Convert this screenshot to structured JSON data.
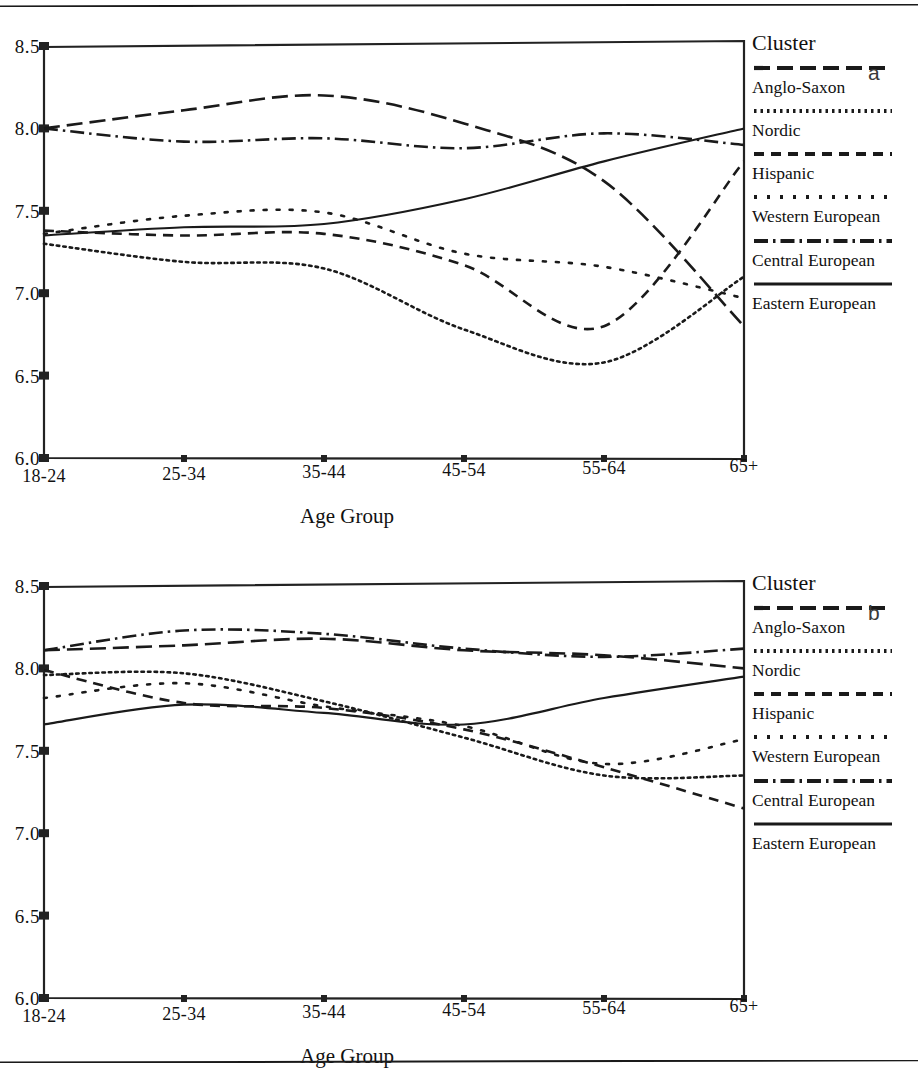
{
  "chart_data": [
    {
      "type": "line",
      "panel_letter": "a",
      "title": "",
      "xlabel": "Age Group",
      "ylabel": "",
      "legend_title": "Cluster",
      "legend_position": "right",
      "grid": false,
      "categories": [
        "18-24",
        "25-34",
        "35-44",
        "45-54",
        "55-64",
        "65+"
      ],
      "ylim": [
        6.0,
        8.5
      ],
      "yticks": [
        "6.0",
        "6.5",
        "7.0",
        "7.5",
        "8.0",
        "8.5"
      ],
      "series": [
        {
          "name": "Anglo-Saxon",
          "style": "long-dash",
          "values": [
            8.0,
            8.11,
            8.2,
            8.03,
            7.68,
            6.8
          ]
        },
        {
          "name": "Nordic",
          "style": "fine-dot",
          "values": [
            7.3,
            7.19,
            7.15,
            6.78,
            6.58,
            7.1
          ]
        },
        {
          "name": "Hispanic",
          "style": "medium-dash",
          "values": [
            7.38,
            7.35,
            7.36,
            7.17,
            6.8,
            7.8
          ]
        },
        {
          "name": "Western European",
          "style": "sparse-dot",
          "values": [
            7.36,
            7.47,
            7.49,
            7.24,
            7.16,
            6.97
          ]
        },
        {
          "name": "Central European",
          "style": "dash-dot",
          "values": [
            8.0,
            7.92,
            7.94,
            7.88,
            7.97,
            7.9
          ]
        },
        {
          "name": "Eastern European",
          "style": "solid",
          "values": [
            7.35,
            7.4,
            7.42,
            7.57,
            7.8,
            8.0
          ]
        }
      ]
    },
    {
      "type": "line",
      "panel_letter": "b",
      "title": "",
      "xlabel": "Age Group",
      "ylabel": "",
      "legend_title": "Cluster",
      "legend_position": "right",
      "grid": false,
      "categories": [
        "18-24",
        "25-34",
        "35-44",
        "45-54",
        "55-64",
        "65+"
      ],
      "ylim": [
        6.0,
        8.5
      ],
      "yticks": [
        "6.0",
        "6.5",
        "7.0",
        "7.5",
        "8.0",
        "8.5"
      ],
      "series": [
        {
          "name": "Anglo-Saxon",
          "style": "long-dash",
          "values": [
            8.11,
            8.14,
            8.18,
            8.11,
            8.08,
            8.0
          ]
        },
        {
          "name": "Nordic",
          "style": "fine-dot",
          "values": [
            7.96,
            7.97,
            7.8,
            7.58,
            7.35,
            7.35
          ]
        },
        {
          "name": "Hispanic",
          "style": "medium-dash",
          "values": [
            7.99,
            7.79,
            7.76,
            7.63,
            7.4,
            7.15
          ]
        },
        {
          "name": "Western European",
          "style": "sparse-dot",
          "values": [
            7.82,
            7.91,
            7.77,
            7.65,
            7.42,
            7.57
          ]
        },
        {
          "name": "Central European",
          "style": "dash-dot",
          "values": [
            8.11,
            8.23,
            8.21,
            8.12,
            8.07,
            8.12
          ]
        },
        {
          "name": "Eastern European",
          "style": "solid",
          "values": [
            7.66,
            7.78,
            7.73,
            7.66,
            7.82,
            7.95
          ]
        }
      ]
    }
  ],
  "panels": [
    {
      "letter": "a",
      "axis_title": "Age Group",
      "yticks": [
        "8.5",
        "8.0",
        "7.5",
        "7.0",
        "6.5",
        "6.0"
      ],
      "xticks": [
        "18-24",
        "25-34",
        "35-44",
        "45-54",
        "55-64",
        "65+"
      ],
      "legend": {
        "title": "Cluster",
        "items": [
          {
            "label": "Anglo-Saxon",
            "style": "long-dash"
          },
          {
            "label": "Nordic",
            "style": "fine-dot"
          },
          {
            "label": "Hispanic",
            "style": "medium-dash"
          },
          {
            "label": "Western European",
            "style": "sparse-dot"
          },
          {
            "label": "Central European",
            "style": "dash-dot"
          },
          {
            "label": "Eastern European",
            "style": "solid"
          }
        ]
      }
    },
    {
      "letter": "b",
      "axis_title": "Age Group",
      "yticks": [
        "8.5",
        "8.0",
        "7.5",
        "7.0",
        "6.5",
        "6.0"
      ],
      "xticks": [
        "18-24",
        "25-34",
        "35-44",
        "45-54",
        "55-64",
        "65+"
      ],
      "legend": {
        "title": "Cluster",
        "items": [
          {
            "label": "Anglo-Saxon",
            "style": "long-dash"
          },
          {
            "label": "Nordic",
            "style": "fine-dot"
          },
          {
            "label": "Hispanic",
            "style": "medium-dash"
          },
          {
            "label": "Western European",
            "style": "sparse-dot"
          },
          {
            "label": "Central European",
            "style": "dash-dot"
          },
          {
            "label": "Eastern European",
            "style": "solid"
          }
        ]
      }
    }
  ],
  "colors": {
    "ink": "#1a1a1a",
    "axis": "#222222",
    "background": "#ffffff"
  }
}
